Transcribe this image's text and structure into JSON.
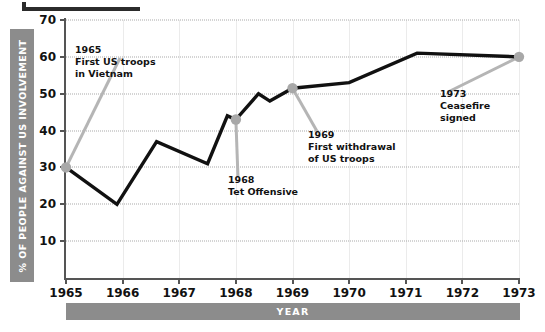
{
  "chart_data": {
    "type": "line",
    "title": "",
    "xlabel": "YEAR",
    "ylabel": "% OF PEOPLE AGAINST US INVOLVEMENT",
    "xlim": [
      1965,
      1973
    ],
    "ylim": [
      0,
      70
    ],
    "grid": true,
    "legend": "none",
    "x_ticks": [
      "1965",
      "1966",
      "1967",
      "1968",
      "1969",
      "1970",
      "1971",
      "1972",
      "1973"
    ],
    "y_ticks": [
      "10",
      "20",
      "30",
      "40",
      "50",
      "60",
      "70"
    ],
    "series": [
      {
        "name": "% of people against US involvement",
        "color": "#111111",
        "x": [
          1965,
          1965.9,
          1966.6,
          1967.5,
          1967.85,
          1968,
          1968.4,
          1968.6,
          1969,
          1970,
          1971.2,
          1973
        ],
        "values": [
          30,
          20,
          37,
          31,
          44,
          43,
          50,
          48,
          51.5,
          53,
          61,
          60
        ]
      }
    ],
    "markers": [
      {
        "label": "1965",
        "x": 1965,
        "value": 30
      },
      {
        "label": "1968",
        "x": 1968,
        "value": 43
      },
      {
        "label": "1969",
        "x": 1969,
        "value": 51.5
      },
      {
        "label": "1973",
        "x": 1973,
        "value": 60
      }
    ],
    "annotations": [
      {
        "year": "1965",
        "line1": "First US troops",
        "line2": "in Vietnam"
      },
      {
        "year": "1968",
        "line1": "Tet Offensive",
        "line2": ""
      },
      {
        "year": "1969",
        "line1": "First withdrawal",
        "line2": "of US troops"
      },
      {
        "year": "1973",
        "line1": "Ceasefire",
        "line2": "signed"
      }
    ],
    "colors": {
      "line": "#111111",
      "marker": "#a8a8a8",
      "leader": "#b5b5b5",
      "bar": "#8c8c8c",
      "grid": "#aaaaaa"
    }
  }
}
